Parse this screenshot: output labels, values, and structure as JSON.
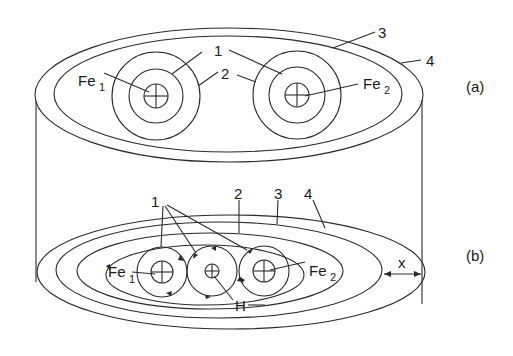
{
  "figure": {
    "panel_a": {
      "tag": "(a)",
      "labels": {
        "coil_left": "Fe",
        "coil_left_sub": "1",
        "coil_right": "Fe",
        "coil_right_sub": "2",
        "one": "1",
        "two": "2",
        "three": "3",
        "four": "4"
      }
    },
    "panel_b": {
      "tag": "(b)",
      "labels": {
        "coil_left": "Fe",
        "coil_left_sub": "1",
        "coil_right": "Fe",
        "coil_right_sub": "2",
        "center": "H",
        "one": "1",
        "two": "2",
        "three": "3",
        "four": "4",
        "distance": "x"
      }
    }
  },
  "colors": {
    "line": "#2a2a2a",
    "background": "#ffffff"
  }
}
